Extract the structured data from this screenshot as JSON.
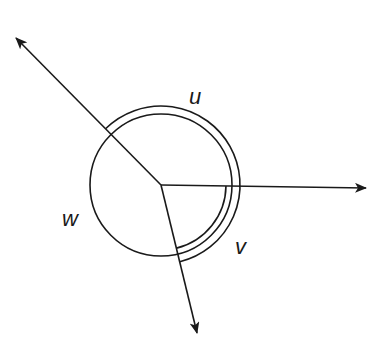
{
  "diagram": {
    "type": "angle-diagram",
    "center": {
      "x": 161,
      "y": 185
    },
    "stroke_color": "#1a1a1a",
    "background": "#ffffff",
    "circle": {
      "radius": 71
    },
    "rays": [
      {
        "name": "ray-northwest",
        "tip": {
          "x": 16,
          "y": 38
        }
      },
      {
        "name": "ray-east",
        "tip": {
          "x": 366,
          "y": 188
        }
      },
      {
        "name": "ray-south",
        "tip": {
          "x": 197,
          "y": 333
        }
      }
    ],
    "arcs": [
      {
        "name": "arc-outer",
        "radius": 79,
        "from_deg": 225.4,
        "to_deg": 76.2
      },
      {
        "name": "arc-inner",
        "radius": 65,
        "from_deg": 0.8,
        "to_deg": 76.2
      }
    ],
    "labels": {
      "u": "u",
      "v": "v",
      "w": "w"
    }
  }
}
